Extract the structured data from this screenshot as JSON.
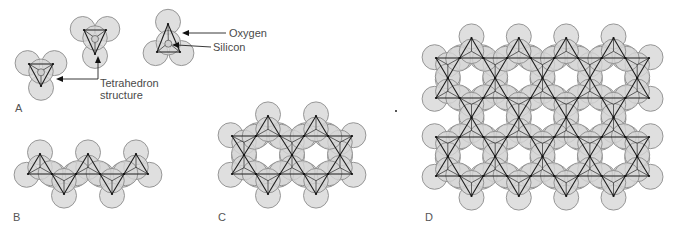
{
  "colors": {
    "oxygen_fill": "#d6d6d6",
    "oxygen_stroke": "#8c8c8c",
    "edge": "#1e1e1e",
    "label": "#4a4a4a"
  },
  "labels": {
    "oxygen": "Oxygen",
    "silicon": "Silicon",
    "tetrahedron_line1": "Tetrahedron",
    "tetrahedron_line2": "structure"
  },
  "panels": [
    {
      "id": "A",
      "label": "A",
      "x": 15,
      "y": 112
    },
    {
      "id": "B",
      "label": "B",
      "x": 13,
      "y": 221
    },
    {
      "id": "C",
      "label": "C",
      "x": 218,
      "y": 221
    },
    {
      "id": "D",
      "label": "D",
      "x": 425,
      "y": 221
    }
  ],
  "structures": {
    "A": {
      "description": "Isolated silica tetrahedra",
      "tetrahedra": [
        [
          29,
          64,
          53,
          64,
          41,
          86
        ],
        [
          84,
          30,
          106,
          30,
          95,
          54
        ],
        [
          168,
          24,
          157,
          52,
          180,
          52
        ]
      ],
      "show_silicon": true
    },
    "B": {
      "description": "Single chain of tetrahedra",
      "tetrahedra": [
        [
          28,
          174,
          52,
          174,
          40,
          154
        ],
        [
          76,
          174,
          100,
          174,
          88,
          154
        ],
        [
          124,
          174,
          148,
          174,
          136,
          154
        ],
        [
          52,
          174,
          76,
          174,
          64,
          194
        ],
        [
          100,
          174,
          124,
          174,
          112,
          194
        ]
      ]
    },
    "C": {
      "description": "Double chain of tetrahedra",
      "rows": [
        136,
        174
      ],
      "x0": 232,
      "pitch": 24,
      "count": 6
    },
    "D": {
      "description": "Sheet of tetrahedra",
      "rows": [
        58,
        98,
        137,
        176
      ],
      "x0": 436,
      "pitch": 23.67,
      "count": 10
    }
  },
  "annotations": {
    "oxygen_arrow": {
      "from": [
        226,
        33
      ],
      "to": [
        183,
        33
      ],
      "text_x": 229,
      "text_y": 37
    },
    "silicon_arrow": {
      "from": [
        211,
        47
      ],
      "to": [
        173,
        45
      ],
      "text_x": 213,
      "text_y": 51
    },
    "tetra_arrow": {
      "points": [
        [
          98,
          57
        ],
        [
          98,
          79
        ],
        [
          57,
          79
        ]
      ],
      "text_x": 100,
      "text_y": 87,
      "text2_y": 99
    }
  },
  "stray_dot": {
    "x": 396,
    "y": 111
  }
}
